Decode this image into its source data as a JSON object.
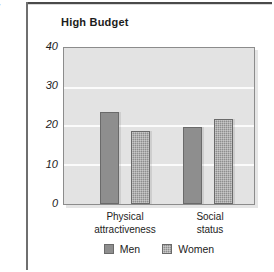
{
  "chart_data": {
    "type": "bar",
    "title": "High Budget",
    "xlabel": "",
    "ylabel": "Percentage of money spent",
    "ylim": [
      0,
      40
    ],
    "yticks": [
      0,
      10,
      20,
      30,
      40
    ],
    "ytick_labels": [
      "0",
      "10",
      "20",
      "30",
      "40"
    ],
    "grid": true,
    "gridlines_at": [
      10,
      20,
      30
    ],
    "legend_position": "bottom-center",
    "categories": [
      "Physical attractiveness",
      "Social status"
    ],
    "category_lines": [
      [
        "Physical",
        "attractiveness"
      ],
      [
        "Social",
        "status"
      ]
    ],
    "series": [
      {
        "name": "Men",
        "values": [
          24,
          20
        ],
        "color": "#8e8e8e",
        "fill": "solid"
      },
      {
        "name": "Women",
        "values": [
          19,
          22
        ],
        "color": "#8e8e8e",
        "fill": "checkered"
      }
    ]
  },
  "legend": {
    "items": [
      {
        "label": "Men"
      },
      {
        "label": "Women"
      }
    ]
  },
  "colors": {
    "bar": "#8e8e8e",
    "bar_edge": "#6a6a6a",
    "plot_background": "#e3e3e3",
    "gridline": "#fbfbfb",
    "text": "#1c1c1c",
    "frame": "#4a4a4a"
  }
}
